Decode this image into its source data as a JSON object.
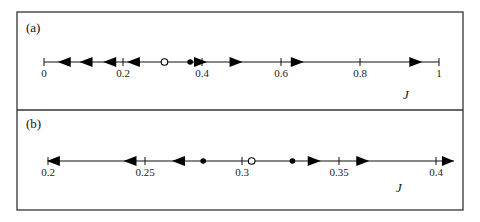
{
  "figure": {
    "frame": {
      "left": 17,
      "right": 463,
      "top": 12,
      "divider": 110,
      "bottom": 210,
      "color": "#333333"
    },
    "panels": [
      {
        "label": "(a)",
        "axis_var": "J",
        "axis_y": 62,
        "x_min": 0,
        "x_max": 1,
        "px_min": 44,
        "px_max": 439,
        "line_start": 44,
        "line_end": 439,
        "end_arrow": false,
        "ticks": [
          {
            "value": 0,
            "label": "0"
          },
          {
            "value": 0.2,
            "label": "0.2"
          },
          {
            "value": 0.4,
            "label": "0.4"
          },
          {
            "value": 0.6,
            "label": "0.6"
          },
          {
            "value": 0.8,
            "label": "0.8"
          },
          {
            "value": 1,
            "label": "1"
          }
        ],
        "arrows": [
          {
            "value": 0.05,
            "dir": "left"
          },
          {
            "value": 0.105,
            "dir": "left"
          },
          {
            "value": 0.165,
            "dir": "left"
          },
          {
            "value": 0.225,
            "dir": "left"
          },
          {
            "value": 0.395,
            "dir": "right"
          },
          {
            "value": 0.485,
            "dir": "right"
          },
          {
            "value": 0.64,
            "dir": "right"
          },
          {
            "value": 0.94,
            "dir": "right"
          }
        ],
        "points": [
          {
            "value": 0.235,
            "type": "filled"
          },
          {
            "value": 0.305,
            "type": "open"
          },
          {
            "value": 0.37,
            "type": "filled"
          }
        ],
        "label_pos": {
          "x": 26,
          "y": 32
        },
        "var_pos": {
          "x": 403,
          "y": 99
        }
      },
      {
        "label": "(b)",
        "axis_var": "J",
        "axis_y": 161,
        "x_min": 0.2,
        "x_max": 0.4,
        "px_min": 48,
        "px_max": 436,
        "line_start": 48,
        "line_end": 454,
        "end_arrow": true,
        "ticks": [
          {
            "value": 0.2,
            "label": "0.2"
          },
          {
            "value": 0.25,
            "label": "0.25"
          },
          {
            "value": 0.3,
            "label": "0.3"
          },
          {
            "value": 0.35,
            "label": "0.35"
          },
          {
            "value": 0.4,
            "label": "0.4"
          }
        ],
        "arrows": [
          {
            "value": 0.2025,
            "dir": "left"
          },
          {
            "value": 0.242,
            "dir": "left"
          },
          {
            "value": 0.267,
            "dir": "left"
          },
          {
            "value": 0.337,
            "dir": "right"
          },
          {
            "value": 0.362,
            "dir": "right"
          }
        ],
        "points": [
          {
            "value": 0.28,
            "type": "filled"
          },
          {
            "value": 0.305,
            "type": "open"
          },
          {
            "value": 0.326,
            "type": "filled"
          }
        ],
        "label_pos": {
          "x": 26,
          "y": 128
        },
        "var_pos": {
          "x": 396,
          "y": 192
        }
      }
    ]
  }
}
